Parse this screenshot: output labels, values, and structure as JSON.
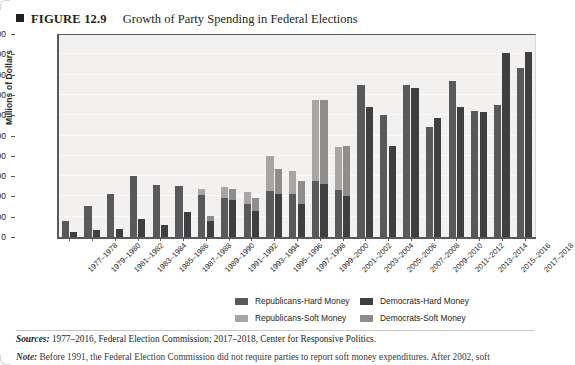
{
  "header": {
    "bullet_icon": "square-bullet-icon",
    "figure_label": "FIGURE 12.9",
    "title": "Growth of Party Spending in Federal Elections"
  },
  "legend": {
    "items": [
      {
        "label": "Republicans-Hard Money",
        "color": "#59595b",
        "swatch": "legend-swatch-republicans-hard"
      },
      {
        "label": "Democrats-Hard Money",
        "color": "#3f3f41",
        "swatch": "legend-swatch-democrats-hard"
      },
      {
        "label": "Republicans-Soft Money",
        "color": "#a7a6a4",
        "swatch": "legend-swatch-republicans-soft"
      },
      {
        "label": "Democrats-Soft Money",
        "color": "#8e8d8b",
        "swatch": "legend-swatch-democrats-soft"
      }
    ]
  },
  "footer": {
    "sources_label": "Sources:",
    "sources_text": " 1977–2016, Federal Election Commission; 2017–2018, Center for Responsive Politics.",
    "note_label": "Note:",
    "note_text": " Before 1991, the Federal Election Commission did not require parties to report soft money expenditures. After 2002, soft"
  },
  "chart_data": {
    "type": "bar",
    "title": "Growth of Party Spending in Federal Elections",
    "xlabel": "",
    "ylabel": "Millions of Dollars",
    "ylim": [
      0,
      1000
    ],
    "ytick_step": 100,
    "yticks": [
      1000,
      900,
      800,
      700,
      600,
      500,
      400,
      300,
      200,
      100,
      0
    ],
    "grid": true,
    "stacked": true,
    "legend_position": "bottom",
    "categories": [
      "1977–1978",
      "1979–1980",
      "1981–1982",
      "1983–1984",
      "1985–1986",
      "1987–1988",
      "1989–1990",
      "1991–1992",
      "1993–1994",
      "1995–1996",
      "1997–1998",
      "1999–2000",
      "2001–2002",
      "2003–2004",
      "2005–2006",
      "2007–2008",
      "2009–2010",
      "2011–2012",
      "2013–2014",
      "2015–2016",
      "2017–2018"
    ],
    "series": [
      {
        "name": "Republicans-Hard Money",
        "color": "#59595b",
        "values": [
          80,
          155,
          210,
          300,
          255,
          250,
          205,
          190,
          165,
          225,
          210,
          275,
          230,
          750,
          600,
          750,
          540,
          770,
          620,
          650,
          835
        ]
      },
      {
        "name": "Republicans-Soft Money",
        "color": "#a7a6a4",
        "values": [
          0,
          0,
          0,
          0,
          0,
          0,
          30,
          55,
          55,
          175,
          115,
          400,
          215,
          0,
          0,
          0,
          0,
          0,
          0,
          0,
          0
        ]
      },
      {
        "name": "Democrats-Hard Money",
        "color": "#3f3f41",
        "values": [
          25,
          35,
          40,
          90,
          60,
          125,
          80,
          180,
          130,
          210,
          165,
          260,
          200,
          640,
          450,
          735,
          585,
          640,
          615,
          905,
          910
        ]
      },
      {
        "name": "Democrats-Soft Money",
        "color": "#8e8d8b",
        "values": [
          0,
          0,
          0,
          0,
          0,
          0,
          25,
          55,
          60,
          125,
          110,
          415,
          250,
          0,
          0,
          0,
          0,
          0,
          0,
          0,
          0
        ]
      }
    ]
  }
}
